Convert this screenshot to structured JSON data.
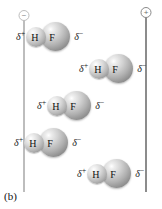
{
  "figure": {
    "caption": "(b)",
    "background_color": "#ffffff"
  },
  "electrodes": [
    {
      "name": "negative-electrode",
      "sign": "−",
      "polarity": "negative",
      "color": "#bdbdbd",
      "x": 24
    },
    {
      "name": "positive-electrode",
      "sign": "+",
      "polarity": "positive",
      "color": "#8c8c8c",
      "x": 146
    }
  ],
  "molecules": [
    {
      "id": 1,
      "delta_plus": "δ",
      "plus_charge": "+",
      "atom_left": "H",
      "atom_right": "F",
      "delta_minus": "δ",
      "minus_charge": "−",
      "left": 16,
      "top": 22
    },
    {
      "id": 2,
      "delta_plus": "δ",
      "plus_charge": "+",
      "atom_left": "H",
      "atom_right": "F",
      "delta_minus": "δ",
      "minus_charge": "−",
      "left": 79,
      "top": 54
    },
    {
      "id": 3,
      "delta_plus": "δ",
      "plus_charge": "+",
      "atom_left": "H",
      "atom_right": "F",
      "delta_minus": "δ",
      "minus_charge": "−",
      "left": 37,
      "top": 91
    },
    {
      "id": 4,
      "delta_plus": "δ",
      "plus_charge": "+",
      "atom_left": "H",
      "atom_right": "F",
      "delta_minus": "δ",
      "minus_charge": "−",
      "left": 14,
      "top": 128
    },
    {
      "id": 5,
      "delta_plus": "δ",
      "plus_charge": "+",
      "atom_left": "H",
      "atom_right": "F",
      "delta_minus": "δ",
      "minus_charge": "−",
      "left": 77,
      "top": 159
    }
  ]
}
